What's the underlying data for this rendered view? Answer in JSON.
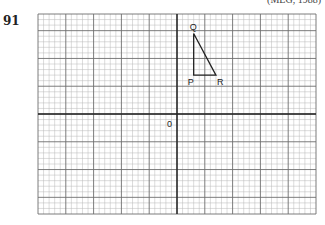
{
  "question": {
    "number": "91",
    "source": "(MEG, 1988)"
  },
  "grid": {
    "left": 38,
    "top": 14,
    "right": 316,
    "bottom": 214,
    "cols": 50,
    "rows": 36,
    "major_every": 5,
    "origin_col": 25,
    "origin_row": 18,
    "minor_color": "#b8b8b8",
    "major_color": "#6e6e6e",
    "axis_color": "#222222"
  },
  "origin_label": "0",
  "triangle": {
    "vertices": [
      {
        "label": "Q",
        "col": 3,
        "row": 14.5
      },
      {
        "label": "P",
        "col": 3,
        "row": 7
      },
      {
        "label": "R",
        "col": 7,
        "row": 7
      }
    ],
    "stroke": "#222222"
  }
}
